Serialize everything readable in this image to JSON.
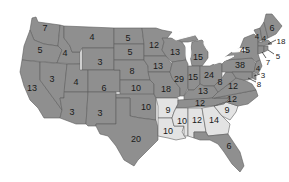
{
  "map": {
    "type": "us-electoral-votes",
    "colors": {
      "group_a": "#8f8f8f",
      "group_b": "#e3e3e3",
      "border": "#5e5e5e",
      "label": "#1a1a1a"
    },
    "states": [
      {
        "id": "WA",
        "label": "7",
        "group": "group_a"
      },
      {
        "id": "OR",
        "label": "5",
        "group": "group_a"
      },
      {
        "id": "CA",
        "label": "13",
        "group": "group_a"
      },
      {
        "id": "ID",
        "label": "4",
        "group": "group_a"
      },
      {
        "id": "NV",
        "label": "3",
        "group": "group_a"
      },
      {
        "id": "MT",
        "label": "4",
        "group": "group_a"
      },
      {
        "id": "WY",
        "label": "3",
        "group": "group_a"
      },
      {
        "id": "UT",
        "label": "4",
        "group": "group_a"
      },
      {
        "id": "AZ",
        "label": "3",
        "group": "group_a"
      },
      {
        "id": "CO",
        "label": "6",
        "group": "group_a"
      },
      {
        "id": "NM",
        "label": "3",
        "group": "group_a"
      },
      {
        "id": "ND",
        "label": "5",
        "group": "group_a"
      },
      {
        "id": "SD",
        "label": "5",
        "group": "group_a"
      },
      {
        "id": "NE",
        "label": "8",
        "group": "group_a"
      },
      {
        "id": "KS",
        "label": "10",
        "group": "group_a"
      },
      {
        "id": "OK",
        "label": "10",
        "group": "group_a"
      },
      {
        "id": "TX",
        "label": "20",
        "group": "group_a"
      },
      {
        "id": "MN",
        "label": "12",
        "group": "group_a"
      },
      {
        "id": "IA",
        "label": "13",
        "group": "group_a"
      },
      {
        "id": "MO",
        "label": "18",
        "group": "group_a"
      },
      {
        "id": "AR",
        "label": "9",
        "group": "group_b"
      },
      {
        "id": "LA",
        "label": "10",
        "group": "group_b"
      },
      {
        "id": "WI",
        "label": "13",
        "group": "group_a"
      },
      {
        "id": "IL",
        "label": "29",
        "group": "group_a"
      },
      {
        "id": "MI",
        "label": "15",
        "group": "group_a"
      },
      {
        "id": "IN",
        "label": "15",
        "group": "group_a"
      },
      {
        "id": "OH",
        "label": "24",
        "group": "group_a"
      },
      {
        "id": "KY",
        "label": "13",
        "group": "group_a"
      },
      {
        "id": "TN",
        "label": "12",
        "group": "group_a"
      },
      {
        "id": "MS",
        "label": "10",
        "group": "group_b"
      },
      {
        "id": "AL",
        "label": "12",
        "group": "group_b"
      },
      {
        "id": "GA",
        "label": "14",
        "group": "group_b"
      },
      {
        "id": "FL",
        "label": "6",
        "group": "group_a"
      },
      {
        "id": "SC",
        "label": "9",
        "group": "group_b"
      },
      {
        "id": "NC",
        "label": "12",
        "group": "group_a"
      },
      {
        "id": "VA",
        "label": "12",
        "group": "group_a"
      },
      {
        "id": "WV",
        "label": "8",
        "group": "group_a"
      },
      {
        "id": "PA",
        "label": "38",
        "group": "group_a"
      },
      {
        "id": "NY",
        "label": "45",
        "group": "group_a"
      },
      {
        "id": "VT",
        "label": "4",
        "group": "group_a"
      },
      {
        "id": "NH",
        "label": "4",
        "group": "group_a"
      },
      {
        "id": "ME",
        "label": "6",
        "group": "group_a"
      },
      {
        "id": "MA",
        "label": "18",
        "group": "group_a"
      },
      {
        "id": "RI",
        "label": "5",
        "group": "group_a"
      },
      {
        "id": "CT",
        "label": "7",
        "group": "group_a"
      },
      {
        "id": "NJ",
        "label": "4",
        "group": "group_a"
      },
      {
        "id": "DE",
        "label": "3",
        "group": "group_a"
      },
      {
        "id": "MD",
        "label": "8",
        "group": "group_a"
      }
    ]
  }
}
